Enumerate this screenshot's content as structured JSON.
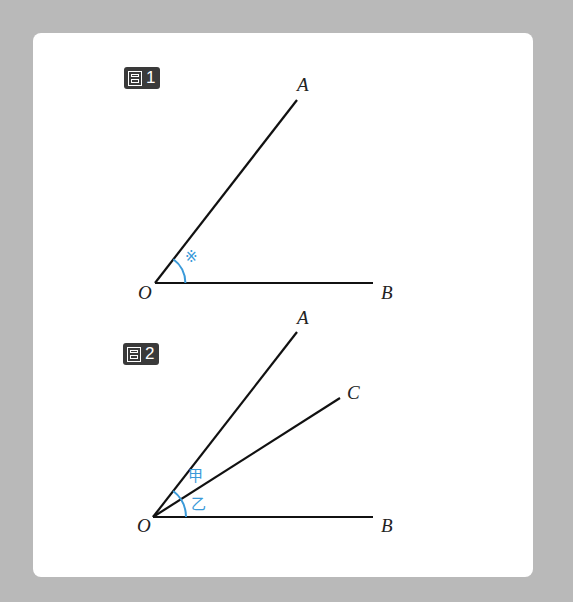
{
  "figures": [
    {
      "badge": "1",
      "labels": {
        "A": "A",
        "B": "B",
        "O": "O"
      },
      "angle_mark": "※"
    },
    {
      "badge": "2",
      "labels": {
        "A": "A",
        "B": "B",
        "C": "C",
        "O": "O"
      },
      "angle_marks": {
        "upper": "甲",
        "lower": "乙"
      }
    }
  ],
  "colors": {
    "background": "#b9b9b9",
    "card": "#ffffff",
    "line": "#111111",
    "angle_arc": "#3a9ad9",
    "badge": "#3a3a3a"
  }
}
